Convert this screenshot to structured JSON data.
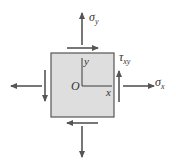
{
  "diagram": {
    "type": "plane stress element",
    "element_fill": "#dedede",
    "element_stroke": "#555555",
    "arrow_color": "#555555",
    "labels": {
      "sigma_y": {
        "sym": "σ",
        "sub": "y"
      },
      "sigma_x": {
        "sym": "σ",
        "sub": "x"
      },
      "tau_xy": {
        "sym": "τ",
        "sub": "xy"
      },
      "origin": "O",
      "axis_x": "x",
      "axis_y": "y"
    }
  }
}
